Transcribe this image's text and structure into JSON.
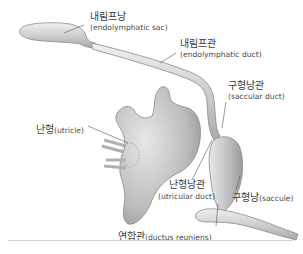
{
  "diagram": {
    "type": "anatomical illustration",
    "labels": [
      {
        "id": "endolymphatic_sac",
        "ko": "내림프낭",
        "en": "(endolymphatic sac)"
      },
      {
        "id": "endolymphatic_duct",
        "ko": "내림프관",
        "en": "(endolymphatic duct)"
      },
      {
        "id": "saccular_duct",
        "ko": "구형낭관",
        "en": "(saccular duct)"
      },
      {
        "id": "utricle",
        "ko": "난형",
        "en": "(utricle)"
      },
      {
        "id": "utricular_duct",
        "ko": "난형낭관",
        "en": "(utricular duct)"
      },
      {
        "id": "saccule",
        "ko": "구형낭",
        "en": "(saccule)"
      },
      {
        "id": "ductus_reuniens",
        "ko": "연합관",
        "en": "(ductus reuniens)"
      }
    ],
    "colors": {
      "organ_fill": "#c9c9c9",
      "organ_highlight": "#ececec",
      "outline": "#8a8a8a",
      "leader_line": "#555555",
      "text": "#3a3a3a",
      "divider": "#cfcfcf"
    }
  }
}
